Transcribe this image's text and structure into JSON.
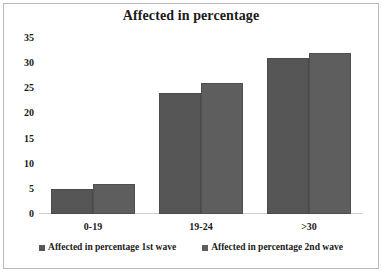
{
  "chart_data": {
    "type": "bar",
    "title": "Affected in percentage",
    "xlabel": "",
    "ylabel": "",
    "categories": [
      "0-19",
      "19-24",
      ">30"
    ],
    "series": [
      {
        "name": "Affected in percentage 1st wave",
        "values": [
          5,
          24,
          31
        ],
        "color": "#565656"
      },
      {
        "name": "Affected in percentage 2nd wave",
        "values": [
          6,
          26,
          32
        ],
        "color": "#5e5e5e"
      }
    ],
    "ylim": [
      0,
      35
    ],
    "ytick_labels": [
      "0",
      "5",
      "10",
      "15",
      "20",
      "25",
      "30",
      "35"
    ],
    "ytick_values": [
      0,
      5,
      10,
      15,
      20,
      25,
      30,
      35
    ],
    "grid": false,
    "legend_position": "bottom",
    "border_color": "#b9b9b9",
    "axis_color": "#d0d0d0",
    "text_color": "#1a1a1a"
  }
}
